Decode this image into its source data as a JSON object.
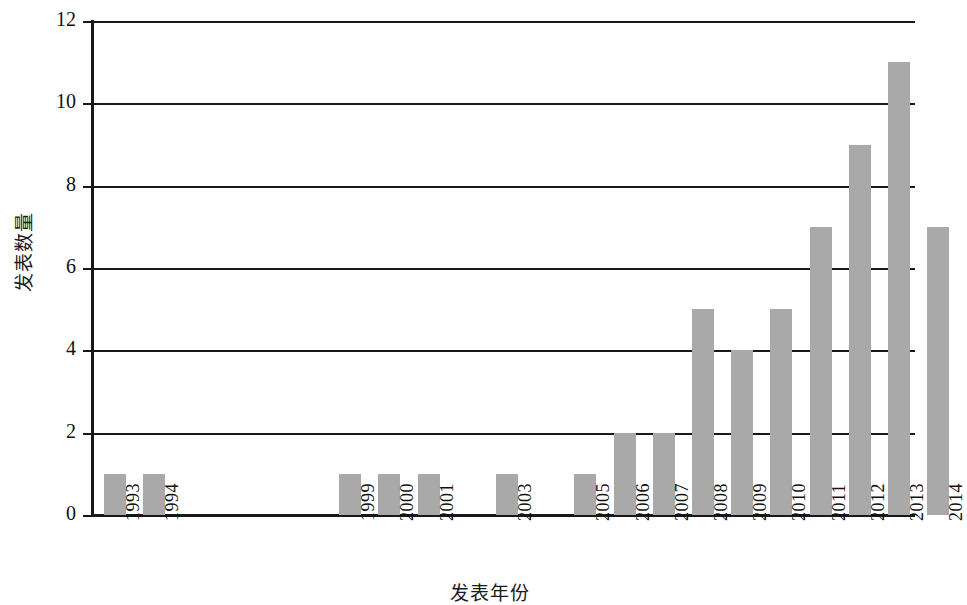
{
  "chart_data": {
    "type": "bar",
    "title": "",
    "subtitle": "",
    "xlabel": "发表年份",
    "ylabel": "发表数量",
    "categories": [
      "1993",
      "1994",
      "1999",
      "2000",
      "2001",
      "2003",
      "2005",
      "2006",
      "2007",
      "2008",
      "2009",
      "2010",
      "2011",
      "2012",
      "2013",
      "2014"
    ],
    "values": [
      1,
      1,
      1,
      1,
      1,
      1,
      1,
      2,
      2,
      5,
      4,
      5,
      7,
      9,
      11,
      7
    ],
    "slot_index": [
      0,
      1,
      6,
      7,
      8,
      10,
      12,
      13,
      14,
      15,
      16,
      17,
      18,
      19,
      20,
      21
    ],
    "slot_count": 22,
    "ylim": [
      0,
      12
    ],
    "y_ticks": [
      "0",
      "2",
      "4",
      "6",
      "8",
      "10",
      "12"
    ],
    "y_tick_values": [
      0,
      2,
      4,
      6,
      8,
      10,
      12
    ],
    "grid": "horizontal",
    "legend": "none",
    "bar_color": "#a9a9a9",
    "axis_color": "#181818",
    "background_color": "#ffffff"
  }
}
